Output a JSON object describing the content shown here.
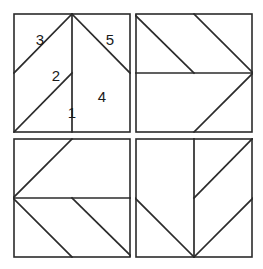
{
  "figure": {
    "panel_count": 4,
    "line_color": "#2b2b2b",
    "background_color": "#ffffff",
    "label_color": "#1a1a1a"
  },
  "panels": [
    {
      "id": "panel-top-left",
      "position": "top-left",
      "rotation_deg": 0,
      "labels_visible": true,
      "labels": [
        {
          "text": "3",
          "x": 26,
          "y": 26
        },
        {
          "text": "2",
          "x": 42,
          "y": 63
        },
        {
          "text": "1",
          "x": 58,
          "y": 100
        },
        {
          "text": "4",
          "x": 88,
          "y": 84
        },
        {
          "text": "5",
          "x": 96,
          "y": 26
        }
      ]
    },
    {
      "id": "panel-top-right",
      "position": "top-right",
      "rotation_deg": 90,
      "labels_visible": false,
      "labels": []
    },
    {
      "id": "panel-bottom-left",
      "position": "bottom-left",
      "rotation_deg": 270,
      "labels_visible": false,
      "labels": []
    },
    {
      "id": "panel-bottom-right",
      "position": "bottom-right",
      "rotation_deg": 180,
      "labels_visible": false,
      "labels": []
    }
  ],
  "geometry": {
    "note": "Unit-square coordinates, origin top-left, 0..1 range",
    "square": {
      "x0": 0,
      "y0": 0,
      "x1": 1,
      "y1": 1
    },
    "seams": [
      {
        "name": "vertical-center",
        "from": [
          0.5,
          0.0
        ],
        "to": [
          0.5,
          1.0
        ]
      },
      {
        "name": "apex-to-left-mid",
        "from": [
          0.5,
          0.0
        ],
        "to": [
          0.0,
          0.5
        ]
      },
      {
        "name": "apex-to-right-mid",
        "from": [
          0.5,
          0.0
        ],
        "to": [
          1.0,
          0.5
        ]
      },
      {
        "name": "bottom-left-to-center",
        "from": [
          0.0,
          1.0
        ],
        "to": [
          0.5,
          0.5
        ]
      }
    ],
    "regions": [
      {
        "label": "1",
        "vertices": [
          [
            0.0,
            1.0
          ],
          [
            0.5,
            0.5
          ],
          [
            0.5,
            1.0
          ]
        ]
      },
      {
        "label": "2",
        "vertices": [
          [
            0.0,
            0.5
          ],
          [
            0.5,
            0.0
          ],
          [
            0.5,
            0.5
          ],
          [
            0.0,
            1.0
          ]
        ]
      },
      {
        "label": "3",
        "vertices": [
          [
            0.0,
            0.0
          ],
          [
            0.5,
            0.0
          ],
          [
            0.0,
            0.5
          ]
        ]
      },
      {
        "label": "4",
        "vertices": [
          [
            0.5,
            0.0
          ],
          [
            1.0,
            0.5
          ],
          [
            1.0,
            1.0
          ],
          [
            0.5,
            1.0
          ]
        ]
      },
      {
        "label": "5",
        "vertices": [
          [
            0.5,
            0.0
          ],
          [
            1.0,
            0.0
          ],
          [
            1.0,
            0.5
          ]
        ]
      }
    ]
  }
}
